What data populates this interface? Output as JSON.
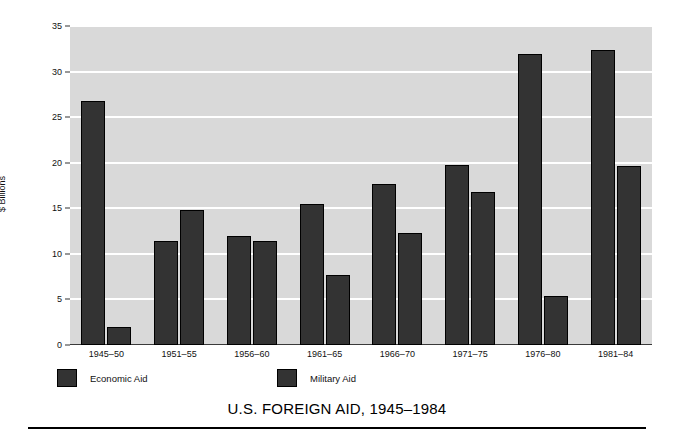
{
  "chart_data": {
    "type": "bar",
    "title": "U.S. FOREIGN AID, 1945–1984",
    "xlabel": "",
    "ylabel": "$ Billions",
    "ylim": [
      0,
      35
    ],
    "ytick_step": 5,
    "yticks": [
      "0",
      "5",
      "10",
      "15",
      "20",
      "25",
      "30",
      "35"
    ],
    "grid": true,
    "legend_position": "below-axes-left",
    "categories": [
      "1945–50",
      "1951–55",
      "1956–60",
      "1961–65",
      "1966–70",
      "1971–75",
      "1976–80",
      "1981–84"
    ],
    "series": [
      {
        "name": "Economic Aid",
        "color": "#333333",
        "values": [
          26.8,
          11.4,
          12.0,
          15.5,
          17.7,
          19.7,
          31.9,
          32.4
        ]
      },
      {
        "name": "Military Aid",
        "color": "#333333",
        "values": [
          2.0,
          14.8,
          11.4,
          7.7,
          12.3,
          16.8,
          5.4,
          19.6
        ]
      }
    ]
  },
  "figure": {
    "background": "#ffffff",
    "plot_background": "#d9d9d9",
    "gridline_color": "#ffffff",
    "bar_fill": "#333333",
    "bar_edge": "#000000"
  }
}
